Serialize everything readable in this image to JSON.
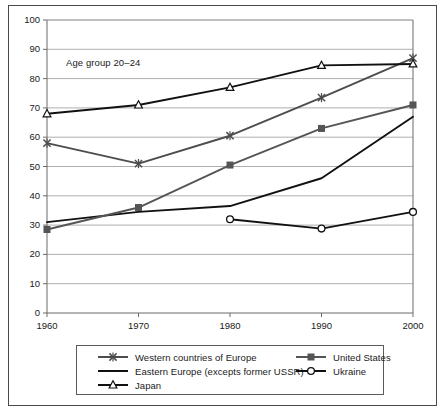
{
  "chart_data": {
    "type": "line",
    "title": "",
    "subtitle": "",
    "annotation": "Age group 20–24",
    "xlabel": "",
    "ylabel": "",
    "x": [
      1960,
      1970,
      1980,
      1990,
      2000
    ],
    "xtick_labels": [
      "1960",
      "1970",
      "1980",
      "1990",
      "2000"
    ],
    "xlim": [
      1960,
      2000
    ],
    "ylim": [
      0,
      100
    ],
    "ytick_labels": [
      "0",
      "10",
      "20",
      "30",
      "40",
      "50",
      "60",
      "70",
      "80",
      "90",
      "100"
    ],
    "yticks": [
      0,
      10,
      20,
      30,
      40,
      50,
      60,
      70,
      80,
      90,
      100
    ],
    "grid": "horizontal",
    "legend_position": "below-plot",
    "series": [
      {
        "name": "Western countries of Europe",
        "marker": "x-cross",
        "color": "#4d4d4d",
        "values": [
          58,
          51,
          60.5,
          73.5,
          87
        ]
      },
      {
        "name": "Eastern Europe (excepts former USSR)",
        "marker": "none",
        "color": "#111111",
        "values": [
          31,
          34.5,
          36.5,
          46,
          67
        ]
      },
      {
        "name": "Japan",
        "marker": "triangle-open",
        "color": "#111111",
        "values": [
          68,
          71,
          77,
          84.5,
          85
        ]
      },
      {
        "name": "United States",
        "marker": "square-filled",
        "color": "#555555",
        "values": [
          28.5,
          36,
          50.5,
          63,
          71
        ]
      },
      {
        "name": "Ukraine",
        "marker": "circle-open",
        "color": "#111111",
        "values": [
          null,
          null,
          32,
          28.8,
          34.5
        ]
      }
    ]
  },
  "legend": {
    "left_column": [
      "Western countries of Europe",
      "Eastern Europe (excepts former USSR)",
      "Japan"
    ],
    "right_column": [
      "United States",
      "Ukraine"
    ]
  },
  "colors": {
    "frame": "#4a4a4a",
    "grid": "#9a9a9a",
    "axis": "#6a6a6a",
    "text": "#1a1a1a",
    "background": "#ffffff"
  }
}
